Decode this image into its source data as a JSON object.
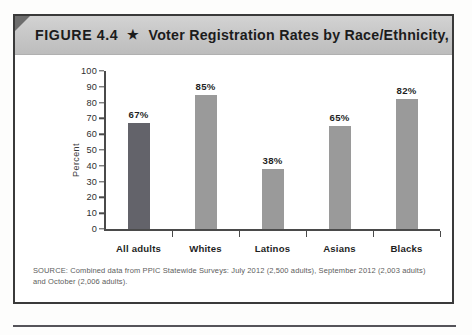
{
  "figure": {
    "number_label": "FIGURE 4.4",
    "separator_icon": "star-icon",
    "separator_glyph": "★",
    "title": "Voter Registration Rates by Race/Ethnicity, 2012",
    "source_note": "SOURCE: Combined data from PPIC Statewide Surveys: July 2012 (2,500 adults), September 2012 (2,003 adults) and October (2,006 adults)."
  },
  "chart_data": {
    "type": "bar",
    "title": "Voter Registration Rates by Race/Ethnicity, 2012",
    "categories": [
      "All adults",
      "Whites",
      "Latinos",
      "Asians",
      "Blacks"
    ],
    "values": [
      67,
      85,
      38,
      65,
      82
    ],
    "value_labels": [
      "67%",
      "85%",
      "38%",
      "65%",
      "82%"
    ],
    "xlabel": "",
    "ylabel": "Percent",
    "ylim": [
      0,
      100
    ],
    "ytick_step": 10,
    "ytick_labels": [
      "100",
      "90",
      "80",
      "70",
      "60",
      "50",
      "40",
      "30",
      "20",
      "10",
      "0"
    ],
    "grid": false,
    "legend": "none",
    "bar_colors": [
      "#63636a",
      "#9a9a9a",
      "#9a9a9a",
      "#9a9a9a",
      "#9a9a9a"
    ],
    "highlight_category": "All adults"
  },
  "colors": {
    "bar_default": "#9a9a9a",
    "bar_highlight": "#63636a",
    "axis": "#4a4a4a",
    "header_band": "#c8c8c8",
    "frame": "#3a3a3a"
  }
}
